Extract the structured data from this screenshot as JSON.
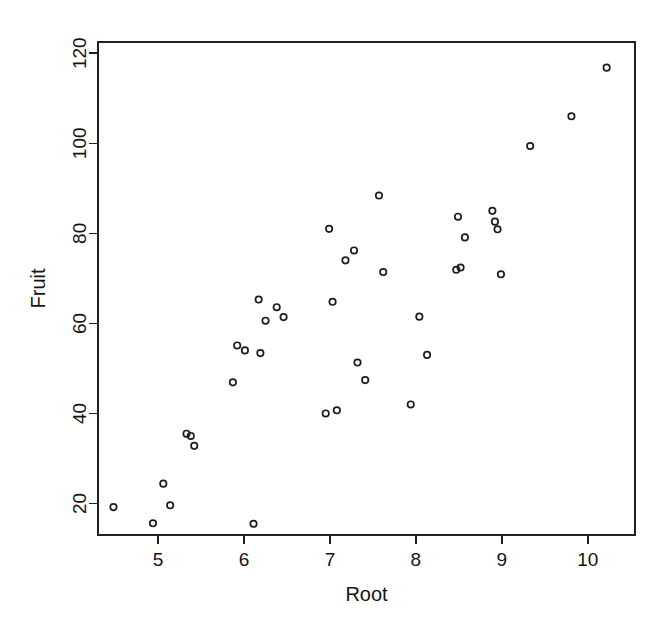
{
  "chart_data": {
    "type": "scatter",
    "title": "",
    "xlabel": "Root",
    "ylabel": "Fruit",
    "xlim": [
      4.3,
      10.55
    ],
    "ylim": [
      13.0,
      122.5
    ],
    "xticks": [
      5,
      6,
      7,
      8,
      9,
      10
    ],
    "yticks": [
      20,
      40,
      60,
      80,
      100,
      120
    ],
    "xtick_labels": [
      "5",
      "6",
      "7",
      "8",
      "9",
      "10"
    ],
    "ytick_labels": [
      "20",
      "40",
      "60",
      "80",
      "100",
      "120"
    ],
    "grid": false,
    "legend": false,
    "marker": "open-circle",
    "marker_color": "#1c1c1c",
    "background": "#ffffff",
    "n_points": 40,
    "points": [
      {
        "x": 4.48,
        "y": 19.2
      },
      {
        "x": 4.94,
        "y": 15.6
      },
      {
        "x": 5.06,
        "y": 24.4
      },
      {
        "x": 5.14,
        "y": 19.6
      },
      {
        "x": 5.33,
        "y": 35.5
      },
      {
        "x": 5.38,
        "y": 35.0
      },
      {
        "x": 5.42,
        "y": 32.8
      },
      {
        "x": 5.87,
        "y": 46.9
      },
      {
        "x": 5.92,
        "y": 55.1
      },
      {
        "x": 6.01,
        "y": 54.0
      },
      {
        "x": 6.11,
        "y": 15.5
      },
      {
        "x": 6.17,
        "y": 65.3
      },
      {
        "x": 6.19,
        "y": 53.4
      },
      {
        "x": 6.25,
        "y": 60.6
      },
      {
        "x": 6.38,
        "y": 63.6
      },
      {
        "x": 6.46,
        "y": 61.4
      },
      {
        "x": 6.95,
        "y": 40.0
      },
      {
        "x": 6.99,
        "y": 81.0
      },
      {
        "x": 7.03,
        "y": 64.8
      },
      {
        "x": 7.08,
        "y": 40.7
      },
      {
        "x": 7.18,
        "y": 74.0
      },
      {
        "x": 7.28,
        "y": 76.2
      },
      {
        "x": 7.32,
        "y": 51.3
      },
      {
        "x": 7.41,
        "y": 47.4
      },
      {
        "x": 7.57,
        "y": 88.4
      },
      {
        "x": 7.62,
        "y": 71.4
      },
      {
        "x": 7.94,
        "y": 42.0
      },
      {
        "x": 8.04,
        "y": 61.5
      },
      {
        "x": 8.13,
        "y": 53.0
      },
      {
        "x": 8.47,
        "y": 71.9
      },
      {
        "x": 8.49,
        "y": 83.7
      },
      {
        "x": 8.52,
        "y": 72.4
      },
      {
        "x": 8.57,
        "y": 79.1
      },
      {
        "x": 8.89,
        "y": 85.0
      },
      {
        "x": 8.92,
        "y": 82.6
      },
      {
        "x": 8.95,
        "y": 80.9
      },
      {
        "x": 8.99,
        "y": 70.9
      },
      {
        "x": 9.33,
        "y": 99.4
      },
      {
        "x": 9.81,
        "y": 106.0
      },
      {
        "x": 10.22,
        "y": 116.8
      }
    ]
  },
  "plot_box": {
    "left": 98,
    "top": 42,
    "right": 635,
    "bottom": 535
  }
}
